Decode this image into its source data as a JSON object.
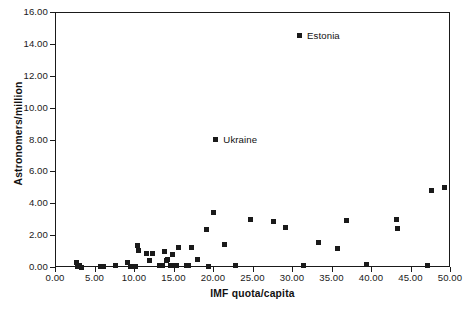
{
  "chart_data": {
    "type": "scatter",
    "title": "",
    "xlabel": "IMF quota/capita",
    "ylabel": "Astronomers/million",
    "xlim": [
      0,
      50
    ],
    "ylim": [
      0,
      16
    ],
    "grid": false,
    "legend": "none",
    "xticks": [
      "0.00",
      "5.00",
      "10.00",
      "15.00",
      "20.00",
      "25.00",
      "30.00",
      "35.00",
      "40.00",
      "45.00",
      "50.00"
    ],
    "yticks": [
      "0.00",
      "2.00",
      "4.00",
      "6.00",
      "8.00",
      "10.00",
      "12.00",
      "14.00",
      "16.00"
    ],
    "xtick_values": [
      0,
      5,
      10,
      15,
      20,
      25,
      30,
      35,
      40,
      45,
      50
    ],
    "ytick_values": [
      0,
      2,
      4,
      6,
      8,
      10,
      12,
      14,
      16
    ],
    "marker_color": "#1a1a1a",
    "marker_shape": "square",
    "points": [
      {
        "x": 2.7,
        "y": 0.3
      },
      {
        "x": 2.9,
        "y": 0.05
      },
      {
        "x": 3.1,
        "y": 0.1
      },
      {
        "x": 3.3,
        "y": 0.0
      },
      {
        "x": 5.7,
        "y": 0.05
      },
      {
        "x": 6.1,
        "y": 0.05
      },
      {
        "x": 7.6,
        "y": 0.1
      },
      {
        "x": 9.2,
        "y": 0.3
      },
      {
        "x": 9.6,
        "y": 0.05
      },
      {
        "x": 9.9,
        "y": 0.05
      },
      {
        "x": 10.2,
        "y": 0.05
      },
      {
        "x": 10.4,
        "y": 1.35
      },
      {
        "x": 10.6,
        "y": 1.05
      },
      {
        "x": 11.6,
        "y": 0.85
      },
      {
        "x": 11.9,
        "y": 0.4
      },
      {
        "x": 12.4,
        "y": 0.85
      },
      {
        "x": 13.2,
        "y": 0.1
      },
      {
        "x": 13.6,
        "y": 0.1
      },
      {
        "x": 13.8,
        "y": 0.95
      },
      {
        "x": 14.1,
        "y": 0.4
      },
      {
        "x": 14.3,
        "y": 0.45
      },
      {
        "x": 14.6,
        "y": 0.1
      },
      {
        "x": 14.9,
        "y": 0.8
      },
      {
        "x": 15.2,
        "y": 0.1
      },
      {
        "x": 15.4,
        "y": 0.1
      },
      {
        "x": 15.6,
        "y": 1.2
      },
      {
        "x": 16.6,
        "y": 0.1
      },
      {
        "x": 16.9,
        "y": 0.1
      },
      {
        "x": 17.3,
        "y": 1.2
      },
      {
        "x": 18.1,
        "y": 0.45
      },
      {
        "x": 19.2,
        "y": 2.35
      },
      {
        "x": 19.4,
        "y": 0.05
      },
      {
        "x": 20.0,
        "y": 3.45
      },
      {
        "x": 20.3,
        "y": 8.0
      },
      {
        "x": 21.4,
        "y": 1.4
      },
      {
        "x": 22.9,
        "y": 0.1
      },
      {
        "x": 24.8,
        "y": 2.95
      },
      {
        "x": 27.6,
        "y": 2.85
      },
      {
        "x": 29.2,
        "y": 2.45
      },
      {
        "x": 30.9,
        "y": 14.5
      },
      {
        "x": 31.4,
        "y": 0.1
      },
      {
        "x": 33.3,
        "y": 1.55
      },
      {
        "x": 35.8,
        "y": 1.15
      },
      {
        "x": 36.9,
        "y": 2.9
      },
      {
        "x": 39.4,
        "y": 0.15
      },
      {
        "x": 43.2,
        "y": 2.95
      },
      {
        "x": 43.4,
        "y": 2.4
      },
      {
        "x": 47.2,
        "y": 0.1
      },
      {
        "x": 47.6,
        "y": 4.8
      },
      {
        "x": 49.3,
        "y": 5.0
      }
    ],
    "annotations": [
      {
        "label": "Estonia",
        "x": 30.9,
        "y": 14.5,
        "dx": 8,
        "dy": 0
      },
      {
        "label": "Ukraine",
        "x": 20.3,
        "y": 8.0,
        "dx": 8,
        "dy": 0
      }
    ]
  }
}
